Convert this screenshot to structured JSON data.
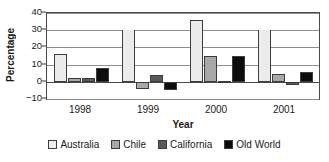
{
  "chart_data": {
    "type": "bar",
    "title": "",
    "xlabel": "Year",
    "ylabel": "Percentage",
    "categories": [
      "1998",
      "1999",
      "2000",
      "2001"
    ],
    "ylim": [
      -10,
      40
    ],
    "yticks": [
      -10,
      0,
      10,
      20,
      30,
      40
    ],
    "ytick_labels": [
      "−10",
      "0",
      "10",
      "20",
      "30",
      "40"
    ],
    "grid": true,
    "legend_position": "bottom",
    "series": [
      {
        "name": "Australia",
        "color": "#ececec",
        "values": [
          16,
          30,
          36,
          30
        ],
        "clipped": [
          false,
          true,
          false,
          true
        ]
      },
      {
        "name": "Chile",
        "color": "#a8a8a8",
        "values": [
          2,
          -4,
          15,
          4.5
        ],
        "clipped": [
          false,
          false,
          false,
          false
        ]
      },
      {
        "name": "California",
        "color": "#595959",
        "values": [
          2.5,
          4,
          0.5,
          -2
        ],
        "clipped": [
          false,
          false,
          false,
          false
        ]
      },
      {
        "name": "Old World",
        "color": "#0d0d0d",
        "values": [
          8,
          -5,
          15,
          5.5
        ],
        "clipped": [
          false,
          false,
          false,
          false
        ]
      }
    ]
  }
}
